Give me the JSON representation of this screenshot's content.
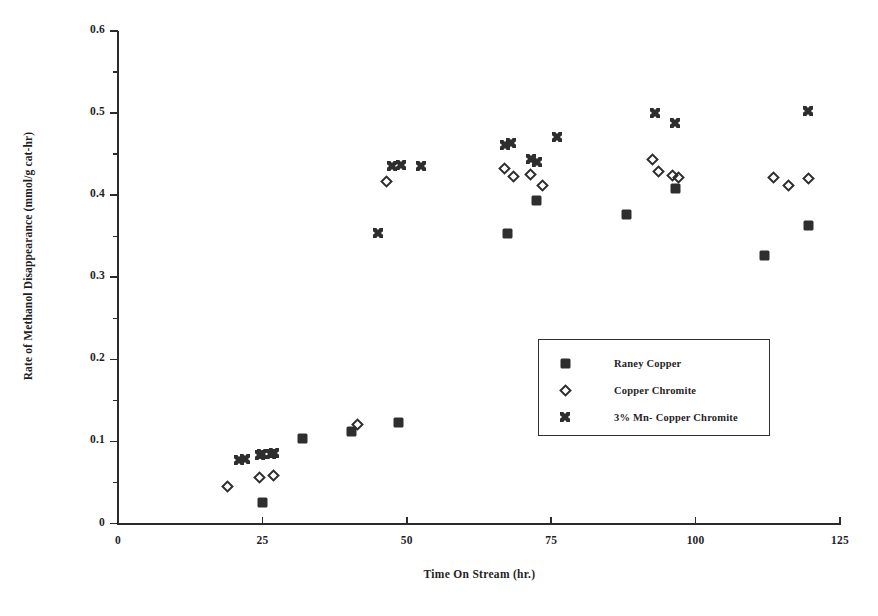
{
  "chart_data": {
    "type": "scatter",
    "title": "",
    "xlabel": "Time On Stream (hr.)",
    "ylabel": "Rate of Methanol Disappearance (mmol/g cat-hr)",
    "xlim": [
      0,
      125
    ],
    "ylim": [
      0,
      0.6
    ],
    "xticks": [
      0,
      25,
      50,
      75,
      100,
      125
    ],
    "xtick_labels": [
      "0",
      "25",
      "50",
      "75",
      "100",
      "125"
    ],
    "yticks": [
      0,
      0.1,
      0.2,
      0.3,
      0.4,
      0.5,
      0.6
    ],
    "ytick_labels": [
      "0",
      "0.1",
      "0.2",
      "0.3",
      "0.4",
      "0.5",
      "0.6"
    ],
    "grid": false,
    "legend_position": "center-right",
    "series": [
      {
        "name": "Raney Copper",
        "marker": "filled-square",
        "color": "#2e2e2e",
        "points": [
          [
            25.0,
            0.026
          ],
          [
            32.0,
            0.103
          ],
          [
            40.5,
            0.112
          ],
          [
            48.5,
            0.123
          ],
          [
            67.5,
            0.353
          ],
          [
            72.5,
            0.394
          ],
          [
            88.0,
            0.377
          ],
          [
            96.5,
            0.408
          ],
          [
            112.0,
            0.326
          ],
          [
            119.5,
            0.363
          ]
        ]
      },
      {
        "name": "Copper Chromite",
        "marker": "open-diamond",
        "color": "#2e2e2e",
        "points": [
          [
            19.0,
            0.045
          ],
          [
            24.5,
            0.056
          ],
          [
            27.0,
            0.058
          ],
          [
            41.5,
            0.121
          ],
          [
            46.5,
            0.417
          ],
          [
            67.0,
            0.433
          ],
          [
            68.5,
            0.423
          ],
          [
            71.5,
            0.425
          ],
          [
            73.5,
            0.412
          ],
          [
            92.5,
            0.443
          ],
          [
            93.5,
            0.429
          ],
          [
            96.0,
            0.424
          ],
          [
            97.0,
            0.421
          ],
          [
            113.5,
            0.422
          ],
          [
            116.0,
            0.412
          ],
          [
            119.5,
            0.42
          ]
        ]
      },
      {
        "name": "3% Mn- Copper Chromite",
        "marker": "star-square",
        "color": "#2e2e2e",
        "points": [
          [
            21.0,
            0.077
          ],
          [
            22.0,
            0.078
          ],
          [
            24.5,
            0.084
          ],
          [
            25.0,
            0.085
          ],
          [
            26.5,
            0.085
          ],
          [
            27.0,
            0.086
          ],
          [
            45.0,
            0.354
          ],
          [
            47.5,
            0.436
          ],
          [
            49.0,
            0.437
          ],
          [
            52.5,
            0.436
          ],
          [
            67.0,
            0.461
          ],
          [
            68.0,
            0.463
          ],
          [
            71.5,
            0.444
          ],
          [
            72.5,
            0.441
          ],
          [
            76.0,
            0.471
          ],
          [
            93.0,
            0.5
          ],
          [
            96.5,
            0.488
          ],
          [
            119.5,
            0.503
          ]
        ]
      }
    ]
  },
  "legend": {
    "items": [
      {
        "label": "Raney Copper",
        "marker": "filled-square"
      },
      {
        "label": "Copper Chromite",
        "marker": "open-diamond"
      },
      {
        "label": "3% Mn- Copper Chromite",
        "marker": "star-square"
      }
    ]
  }
}
